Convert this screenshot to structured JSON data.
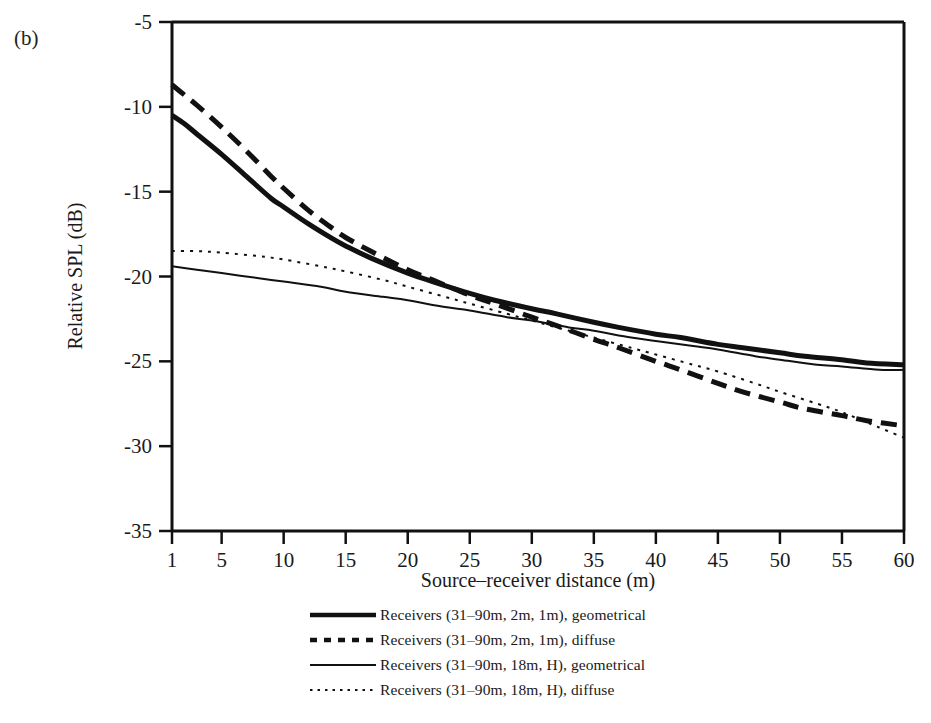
{
  "panel": {
    "label": "(b)"
  },
  "chart_data": {
    "type": "line",
    "title": "",
    "xlabel": "Source–receiver distance (m)",
    "ylabel": "Relative SPL (dB)",
    "xlim": [
      1,
      60
    ],
    "ylim": [
      -35,
      -5
    ],
    "grid": false,
    "legend_position": "below",
    "xticks": [
      1,
      5,
      10,
      15,
      20,
      25,
      30,
      35,
      40,
      45,
      50,
      55,
      60
    ],
    "xtick_labels": [
      "1",
      "5",
      "10",
      "15",
      "20",
      "25",
      "30",
      "35",
      "40",
      "45",
      "50",
      "55",
      "60"
    ],
    "yticks": [
      -5,
      -10,
      -15,
      -20,
      -25,
      -30,
      -35
    ],
    "ytick_labels": [
      "-5",
      "-10",
      "-15",
      "-20",
      "-25",
      "-30",
      "-35"
    ],
    "series": [
      {
        "name": "Receivers (31–90m, 2m, 1m), geometrical",
        "style": "solid",
        "width": "thick",
        "color": "#111111",
        "x": [
          1,
          2,
          3,
          5,
          7,
          9,
          10,
          12,
          14,
          15,
          17,
          20,
          22,
          25,
          27,
          30,
          32,
          35,
          37,
          40,
          42,
          45,
          47,
          50,
          52,
          55,
          57,
          60
        ],
        "y": [
          -10.5,
          -11.0,
          -11.6,
          -12.8,
          -14.1,
          -15.4,
          -15.9,
          -16.9,
          -17.8,
          -18.2,
          -18.9,
          -19.8,
          -20.3,
          -21.0,
          -21.4,
          -21.9,
          -22.2,
          -22.7,
          -23.0,
          -23.4,
          -23.6,
          -24.0,
          -24.2,
          -24.5,
          -24.7,
          -24.9,
          -25.1,
          -25.2
        ]
      },
      {
        "name": "Receivers (31–90m, 2m, 1m), diffuse",
        "style": "dashed",
        "width": "thick",
        "color": "#111111",
        "x": [
          1,
          2,
          3,
          5,
          7,
          9,
          10,
          12,
          14,
          15,
          17,
          20,
          22,
          25,
          27,
          30,
          32,
          35,
          37,
          40,
          42,
          45,
          47,
          50,
          52,
          55,
          57,
          60
        ],
        "y": [
          -8.7,
          -9.3,
          -9.9,
          -11.2,
          -12.6,
          -14.1,
          -14.8,
          -16.1,
          -17.2,
          -17.7,
          -18.5,
          -19.6,
          -20.2,
          -21.1,
          -21.6,
          -22.4,
          -22.9,
          -23.7,
          -24.2,
          -25.0,
          -25.5,
          -26.3,
          -26.8,
          -27.4,
          -27.8,
          -28.2,
          -28.5,
          -28.8
        ]
      },
      {
        "name": "Receivers (31–90m, 18m, H), geometrical",
        "style": "solid",
        "width": "thin",
        "color": "#111111",
        "x": [
          1,
          3,
          5,
          8,
          10,
          13,
          15,
          18,
          20,
          23,
          25,
          28,
          30,
          33,
          35,
          38,
          40,
          43,
          45,
          48,
          50,
          53,
          55,
          58,
          60
        ],
        "y": [
          -19.4,
          -19.6,
          -19.8,
          -20.1,
          -20.3,
          -20.6,
          -20.9,
          -21.2,
          -21.4,
          -21.8,
          -22.0,
          -22.4,
          -22.6,
          -23.0,
          -23.2,
          -23.6,
          -23.8,
          -24.1,
          -24.3,
          -24.7,
          -24.9,
          -25.2,
          -25.3,
          -25.5,
          -25.5
        ]
      },
      {
        "name": "Receivers (31–90m, 18m, H), diffuse",
        "style": "dotted",
        "width": "thin",
        "color": "#111111",
        "x": [
          1,
          3,
          5,
          8,
          10,
          13,
          15,
          18,
          20,
          23,
          25,
          28,
          30,
          33,
          35,
          38,
          40,
          43,
          45,
          48,
          50,
          53,
          55,
          58,
          60
        ],
        "y": [
          -18.5,
          -18.5,
          -18.6,
          -18.8,
          -19.0,
          -19.4,
          -19.7,
          -20.2,
          -20.6,
          -21.2,
          -21.6,
          -22.2,
          -22.6,
          -23.2,
          -23.6,
          -24.2,
          -24.6,
          -25.2,
          -25.6,
          -26.3,
          -26.8,
          -27.5,
          -28.0,
          -28.9,
          -29.5
        ]
      }
    ]
  },
  "legend": {
    "items": [
      {
        "label": "Receivers (31–90m, 2m, 1m), geometrical",
        "key": "thick-solid-line"
      },
      {
        "label": "Receivers (31–90m, 2m, 1m), diffuse",
        "key": "thick-dashed-line"
      },
      {
        "label": "Receivers (31–90m, 18m, H), geometrical",
        "key": "thin-solid-line"
      },
      {
        "label": "Receivers (31–90m, 18m, H), diffuse",
        "key": "thin-dotted-line"
      }
    ]
  }
}
